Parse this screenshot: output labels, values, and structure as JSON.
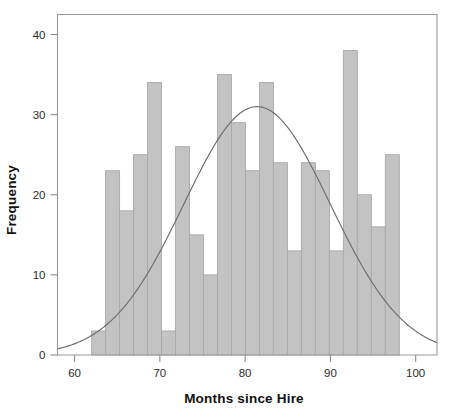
{
  "chart_data": {
    "type": "bar",
    "title": "",
    "subtitle": "",
    "xlabel": "Months since Hire",
    "ylabel": "Frequency",
    "xlim": [
      58.0,
      102.5
    ],
    "ylim": [
      0,
      42.5
    ],
    "xticks": [
      60,
      70,
      80,
      90,
      100
    ],
    "xticklabels": [
      "60",
      "70",
      "80",
      "90",
      "100"
    ],
    "yticks": [
      0,
      10,
      20,
      30,
      40
    ],
    "yticklabels": [
      "0",
      "10",
      "20",
      "30",
      "40"
    ],
    "grid": false,
    "legend": false,
    "bin_width": 1.64,
    "bin_start": 62.0,
    "bin_edges": [
      62.0,
      63.64,
      65.28,
      66.92,
      68.56,
      70.2,
      71.84,
      73.48,
      75.12,
      76.76,
      78.4,
      80.04,
      81.68,
      83.32,
      84.96,
      86.6,
      88.24,
      89.88,
      91.52,
      93.16,
      94.8,
      96.44,
      98.08
    ],
    "bin_centers": [
      62.8,
      64.5,
      66.1,
      67.7,
      69.4,
      71.0,
      72.7,
      74.3,
      75.9,
      77.6,
      79.2,
      80.9,
      82.5,
      84.1,
      85.8,
      87.4,
      89.1,
      90.7,
      92.3,
      94.0,
      95.6,
      97.3
    ],
    "categories": [
      "62-64",
      "64-65",
      "65-67",
      "67-69",
      "69-70",
      "70-72",
      "72-73",
      "73-75",
      "75-77",
      "77-78",
      "78-80",
      "80-82",
      "82-83",
      "83-85",
      "85-87",
      "87-88",
      "88-90",
      "90-92",
      "92-93",
      "93-95",
      "95-96",
      "96-98"
    ],
    "values": [
      3,
      23,
      18,
      25,
      34,
      3,
      26,
      15,
      10,
      35,
      29,
      23,
      34,
      24,
      13,
      24,
      23,
      13,
      38,
      20,
      16,
      25
    ],
    "overlay": {
      "type": "line",
      "name": "normal-curve",
      "mean": 81.4,
      "sigma": 8.6,
      "peak": 31,
      "description": "fitted normal distribution curve overlaid on histogram"
    },
    "colors": {
      "bar_fill": "#c3c3c3",
      "bar_edge": "#a9a9a9",
      "curve": "#6d6d6d",
      "axis": "#9a9a9a",
      "text": "#111111",
      "background": "#ffffff"
    }
  }
}
